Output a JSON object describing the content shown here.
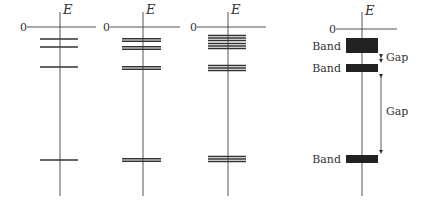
{
  "axis_label": "E",
  "zero_label": "0",
  "diagrams": [
    {
      "name": "diagram-1-atom",
      "levels": [
        [
          0.0
        ],
        [
          0.0
        ],
        [
          0.0
        ],
        [
          0.0
        ]
      ],
      "description": "single energy levels"
    },
    {
      "name": "diagram-2-two-atoms",
      "levels": [
        [
          0.0
        ],
        [
          0.0
        ],
        [
          0.0
        ],
        [
          0.0
        ]
      ],
      "description": "doubled energy levels"
    },
    {
      "name": "diagram-3-many-atoms",
      "levels": [
        [
          0.0
        ],
        [
          0.0
        ],
        [
          0.0
        ],
        [
          0.0
        ]
      ],
      "description": "multiplied energy levels"
    }
  ],
  "band_diagram": {
    "band_label": "Band",
    "gap_label": "Gap",
    "bands": [
      "Band",
      "Band",
      "Band"
    ],
    "gaps": [
      "Gap",
      "Gap"
    ]
  },
  "colors": {
    "line": "#333333",
    "axis": "#555555",
    "band": "#222222"
  }
}
